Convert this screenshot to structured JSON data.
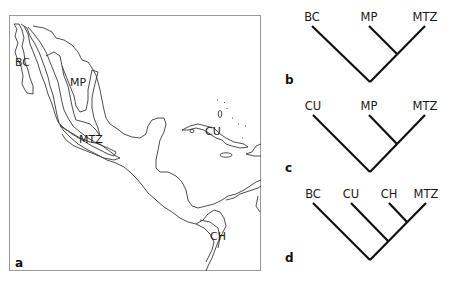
{
  "figure": {
    "panels": [
      {
        "letter": "a",
        "type": "map",
        "region_labels": [
          "BC",
          "MP",
          "MTZ",
          "CU",
          "CH"
        ]
      },
      {
        "letter": "b",
        "type": "cladogram",
        "taxa": [
          "BC",
          "MP",
          "MTZ"
        ],
        "topology": "(BC,(MP,MTZ))"
      },
      {
        "letter": "c",
        "type": "cladogram",
        "taxa": [
          "CU",
          "MP",
          "MTZ"
        ],
        "topology": "(CU,(MP,MTZ))"
      },
      {
        "letter": "d",
        "type": "cladogram",
        "taxa": [
          "BC",
          "CU",
          "CH",
          "MTZ"
        ],
        "topology": "(BC,(CU,(CH,MTZ)))"
      }
    ]
  }
}
